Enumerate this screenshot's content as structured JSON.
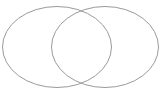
{
  "canvas": {
    "width": 164,
    "height": 91,
    "background_color": "#ffffff"
  },
  "diagram": {
    "type": "venn-two-set",
    "title": "",
    "stroke_color": "#9a9a9a",
    "stroke_width": 1,
    "fill": "none",
    "labels": [],
    "shapes": [
      {
        "name": "left-set-ellipse",
        "cx": 57,
        "cy": 47,
        "rx": 54.5,
        "ry": 40.5,
        "label": ""
      },
      {
        "name": "right-set-ellipse",
        "cx": 105,
        "cy": 47,
        "rx": 53.5,
        "ry": 40.5,
        "label": ""
      }
    ],
    "intersection": {
      "name": "overlap-lens",
      "top_point_x": 81,
      "top_point_y": 7,
      "bottom_point_x": 81,
      "bottom_point_y": 87,
      "label": ""
    }
  }
}
